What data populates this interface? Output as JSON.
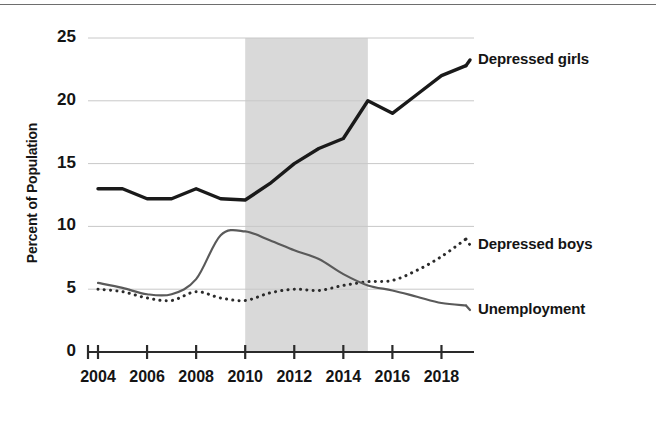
{
  "chart_data": {
    "type": "line",
    "title": "",
    "subtitle": "",
    "xlabel": "",
    "ylabel": "Percent of Population",
    "xlim": [
      2004,
      2019
    ],
    "ylim": [
      0,
      25
    ],
    "grid": true,
    "grid_axis": "y",
    "legend_position": "right-inline",
    "y_ticks": [
      0,
      5,
      10,
      15,
      20,
      25
    ],
    "y_tick_labels": [
      "0",
      "5",
      "10",
      "15",
      "20",
      "25"
    ],
    "x_ticks": [
      2004,
      2006,
      2008,
      2010,
      2012,
      2014,
      2016,
      2018
    ],
    "x_tick_labels": [
      "2004",
      "2006",
      "2008",
      "2010",
      "2012",
      "2014",
      "2016",
      "2018"
    ],
    "x": [
      2004,
      2005,
      2006,
      2007,
      2008,
      2009,
      2010,
      2011,
      2012,
      2013,
      2014,
      2015,
      2016,
      2017,
      2018,
      2019
    ],
    "series": [
      {
        "name": "Depressed girls",
        "style": "solid-thick",
        "color": "#1a1a1a",
        "values": [
          13.0,
          13.0,
          12.2,
          12.2,
          13.0,
          12.2,
          12.1,
          13.4,
          15.0,
          16.2,
          17.0,
          20.0,
          19.0,
          20.5,
          22.0,
          22.8
        ]
      },
      {
        "name": "Depressed boys",
        "style": "dotted",
        "color": "#2b2b2b",
        "values": [
          5.0,
          4.8,
          4.3,
          4.1,
          4.8,
          4.3,
          4.1,
          4.7,
          5.0,
          4.9,
          5.3,
          5.6,
          5.7,
          6.5,
          7.6,
          9.0
        ]
      },
      {
        "name": "Unemployment",
        "style": "solid-thin",
        "color": "#5a5a5a",
        "values": [
          5.5,
          5.1,
          4.6,
          4.6,
          5.8,
          9.3,
          9.6,
          8.9,
          8.1,
          7.4,
          6.2,
          5.3,
          4.9,
          4.4,
          3.9,
          3.7
        ]
      }
    ],
    "shaded_region": {
      "label": "",
      "x_start": 2010,
      "x_end": 2015,
      "color": "#d9d9d9"
    },
    "annotations": [
      {
        "text": "Depressed girls",
        "series": "Depressed girls"
      },
      {
        "text": "Depressed boys",
        "series": "Depressed boys"
      },
      {
        "text": "Unemployment",
        "series": "Unemployment"
      }
    ]
  },
  "axis": {
    "y_title": "Percent of Population"
  },
  "colors": {
    "girls": "#1a1a1a",
    "boys": "#2b2b2b",
    "unemployment": "#5a5a5a",
    "shade": "#d9d9d9",
    "grid": "#c8c8c8",
    "axis": "#2a2a2a",
    "background": "#ffffff"
  }
}
